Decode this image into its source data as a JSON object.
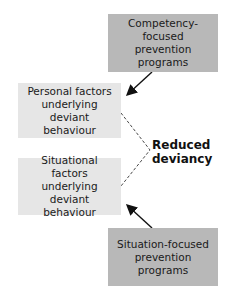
{
  "diagram": {
    "nodes": {
      "competency_programs": {
        "label": "Competency-focused prevention programs",
        "lines": [
          "Competency-focused",
          "prevention",
          "programs"
        ],
        "fill": "#b8b8b8"
      },
      "personal_factors": {
        "label": "Personal factors underlying deviant behaviour",
        "lines": [
          "Personal factors",
          "underlying deviant",
          "behaviour"
        ],
        "fill": "#e6e6e6"
      },
      "situational_factors": {
        "label": "Situational factors underlying deviant behaviour",
        "lines": [
          "Situational factors",
          "underlying deviant",
          "behaviour"
        ],
        "fill": "#e6e6e6"
      },
      "situation_programs": {
        "label": "Situation-focused prevention programs",
        "lines": [
          "Situation-focused",
          "prevention",
          "programs"
        ],
        "fill": "#b8b8b8"
      },
      "outcome": {
        "label": "Reduced deviancy",
        "lines": [
          "Reduced",
          "deviancy"
        ]
      }
    },
    "edges": [
      {
        "from": "competency_programs",
        "to": "personal_factors",
        "style": "solid-arrow"
      },
      {
        "from": "situation_programs",
        "to": "situational_factors",
        "style": "solid-arrow"
      },
      {
        "from": "personal_factors",
        "to": "outcome",
        "style": "dashed"
      },
      {
        "from": "situational_factors",
        "to": "outcome",
        "style": "dashed"
      }
    ]
  }
}
